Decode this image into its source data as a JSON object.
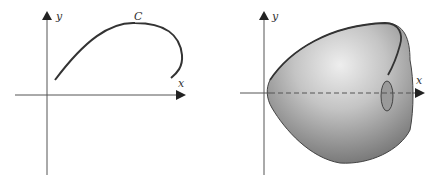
{
  "left_panel": {
    "y_label": "y",
    "x_label": "x",
    "curve_label": "C"
  },
  "right_panel": {
    "y_label": "y",
    "x_label": "x"
  },
  "colors": {
    "axis": "#555555",
    "curve": "#333333",
    "surface_light": "#e6e6e6",
    "surface_dark": "#8a8a8a"
  }
}
